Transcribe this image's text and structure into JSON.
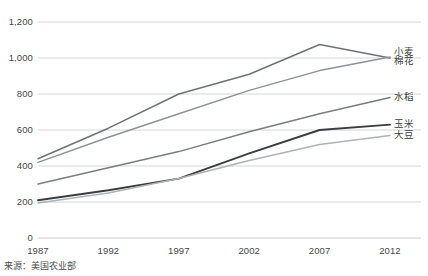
{
  "chart_data": {
    "type": "line",
    "title": "",
    "subtitle": "",
    "xlabel": "",
    "ylabel": "",
    "x": [
      1987,
      1992,
      1997,
      2002,
      2007,
      2012
    ],
    "xticklabels": [
      "1987",
      "1992",
      "1997",
      "2002",
      "2007",
      "2012"
    ],
    "yticks": [
      0,
      200,
      400,
      600,
      800,
      1000,
      1200
    ],
    "yticklabels": [
      "0",
      "200",
      "400",
      "600",
      "800",
      "1,000",
      "1,200"
    ],
    "ylim": [
      0,
      1200
    ],
    "xlim": [
      1987,
      2012
    ],
    "grid": true,
    "legend_position": "right-inline",
    "series": [
      {
        "name": "小麦",
        "color": "#6f7275",
        "values": [
          440,
          610,
          800,
          910,
          1075,
          1000
        ]
      },
      {
        "name": "棉花",
        "color": "#8f9295",
        "values": [
          420,
          560,
          690,
          820,
          930,
          1005
        ]
      },
      {
        "name": "水稻",
        "color": "#7a7d80",
        "values": [
          300,
          390,
          480,
          590,
          690,
          780
        ]
      },
      {
        "name": "玉米",
        "color": "#3b3d40",
        "values": [
          210,
          265,
          330,
          470,
          600,
          630
        ]
      },
      {
        "name": "大豆",
        "color": "#b0b3b6",
        "values": [
          195,
          250,
          330,
          430,
          520,
          570
        ]
      }
    ],
    "source_note": "来源：美国农业部"
  }
}
